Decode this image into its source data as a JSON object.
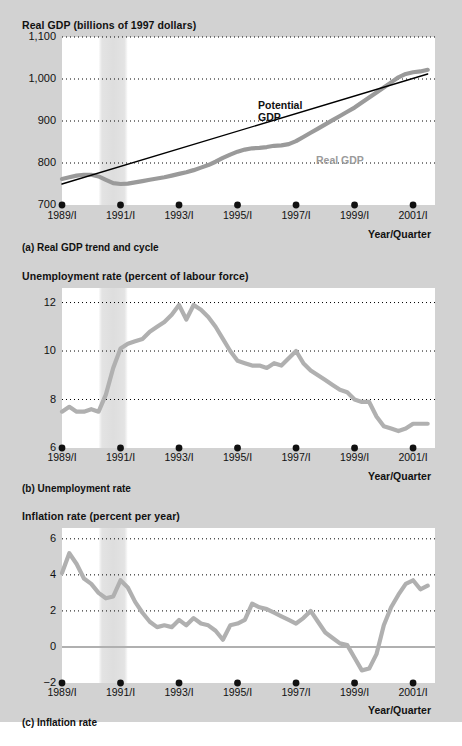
{
  "figure": {
    "background": "#d2d2d2",
    "plot_background": "#ffffff",
    "accent_grey": "#a8a8a8",
    "line_black": "#000000"
  },
  "panels": [
    {
      "id": "a",
      "title": "Real GDP (billions of 1997 dollars)",
      "caption": "(a) Real GDP trend and cycle",
      "x_axis_name": "Year/Quarter",
      "y_ticks": [
        "1,100",
        "1,000",
        "900",
        "800",
        "700"
      ],
      "x_ticks": [
        "1989/I",
        "1991/I",
        "1993/I",
        "1995/I",
        "1997/I",
        "1999/I",
        "2001/I"
      ],
      "series_labels": [
        {
          "name": "Potential GDP",
          "line1": "Potential",
          "line2": "GDP",
          "color": "#000000"
        },
        {
          "name": "Real GDP",
          "line1": "Real GDP",
          "line2": "",
          "color": "#9a9a9a"
        }
      ]
    },
    {
      "id": "b",
      "title": "Unemployment rate (percent of labour force)",
      "caption": "(b) Unemployment rate",
      "x_axis_name": "Year/Quarter",
      "y_ticks": [
        "12",
        "10",
        "8",
        "6"
      ],
      "x_ticks": [
        "1989/I",
        "1991/I",
        "1993/I",
        "1995/I",
        "1997/I",
        "1999/I",
        "2001/I"
      ]
    },
    {
      "id": "c",
      "title": "Inflation rate (percent per year)",
      "caption": "(c) Inflation rate",
      "x_axis_name": "Year/Quarter",
      "y_ticks": [
        "6",
        "4",
        "2",
        "0",
        "−2"
      ],
      "x_ticks": [
        "1989/I",
        "1991/I",
        "1993/I",
        "1995/I",
        "1997/I",
        "1999/I",
        "2001/I"
      ]
    }
  ],
  "chart_data": [
    {
      "type": "line",
      "panel": "a",
      "title": "Real GDP (billions of 1997 dollars)",
      "xlabel": "Year/Quarter",
      "ylabel": "Real GDP (billions of 1997 dollars)",
      "ylim": [
        700,
        1100
      ],
      "yticks": [
        700,
        800,
        900,
        1000,
        1100
      ],
      "xlim": [
        1989.0,
        2001.75
      ],
      "xticks": [
        1989,
        1991,
        1993,
        1995,
        1997,
        1999,
        2001
      ],
      "xticklabels": [
        "1989/I",
        "1991/I",
        "1993/I",
        "1995/I",
        "1997/I",
        "1999/I",
        "2001/I"
      ],
      "grid": "horizontal-dotted",
      "legend": "inline-annotations",
      "recession_shading": [
        [
          1990.25,
          1991.25
        ]
      ],
      "series": [
        {
          "name": "Real GDP",
          "color": "#9a9a9a",
          "x": [
            1989.0,
            1989.25,
            1989.5,
            1989.75,
            1990.0,
            1990.25,
            1990.5,
            1990.75,
            1991.0,
            1991.25,
            1991.5,
            1991.75,
            1992.0,
            1992.25,
            1992.5,
            1992.75,
            1993.0,
            1993.25,
            1993.5,
            1993.75,
            1994.0,
            1994.25,
            1994.5,
            1994.75,
            1995.0,
            1995.25,
            1995.5,
            1995.75,
            1996.0,
            1996.25,
            1996.5,
            1996.75,
            1997.0,
            1997.25,
            1997.5,
            1997.75,
            1998.0,
            1998.25,
            1998.5,
            1998.75,
            1999.0,
            1999.25,
            1999.5,
            1999.75,
            2000.0,
            2000.25,
            2000.5,
            2000.75,
            2001.0,
            2001.25,
            2001.5
          ],
          "y": [
            762,
            766,
            770,
            772,
            772,
            768,
            760,
            752,
            750,
            751,
            754,
            757,
            760,
            763,
            766,
            770,
            774,
            778,
            783,
            789,
            795,
            803,
            812,
            820,
            827,
            832,
            835,
            836,
            838,
            841,
            842,
            845,
            852,
            862,
            872,
            882,
            892,
            902,
            912,
            922,
            932,
            944,
            956,
            968,
            980,
            992,
            1004,
            1012,
            1016,
            1018,
            1022
          ]
        },
        {
          "name": "Potential GDP",
          "color": "#000000",
          "x": [
            1989.0,
            2001.5
          ],
          "y": [
            750,
            1012
          ]
        }
      ]
    },
    {
      "type": "line",
      "panel": "b",
      "title": "Unemployment rate (percent of labour force)",
      "xlabel": "Year/Quarter",
      "ylabel": "Unemployment rate (percent of labour force)",
      "ylim": [
        6,
        12.6
      ],
      "yticks": [
        6,
        8,
        10,
        12
      ],
      "xlim": [
        1989.0,
        2001.75
      ],
      "xticks": [
        1989,
        1991,
        1993,
        1995,
        1997,
        1999,
        2001
      ],
      "xticklabels": [
        "1989/I",
        "1991/I",
        "1993/I",
        "1995/I",
        "1997/I",
        "1999/I",
        "2001/I"
      ],
      "grid": "horizontal-dotted",
      "recession_shading": [
        [
          1990.25,
          1991.25
        ]
      ],
      "series": [
        {
          "name": "Unemployment rate",
          "color": "#b0b0b0",
          "x": [
            1989.0,
            1989.25,
            1989.5,
            1989.75,
            1990.0,
            1990.25,
            1990.5,
            1990.75,
            1991.0,
            1991.25,
            1991.5,
            1991.75,
            1992.0,
            1992.25,
            1992.5,
            1992.75,
            1993.0,
            1993.25,
            1993.5,
            1993.75,
            1994.0,
            1994.25,
            1994.5,
            1994.75,
            1995.0,
            1995.25,
            1995.5,
            1995.75,
            1996.0,
            1996.25,
            1996.5,
            1996.75,
            1997.0,
            1997.25,
            1997.5,
            1997.75,
            1998.0,
            1998.25,
            1998.5,
            1998.75,
            1999.0,
            1999.25,
            1999.5,
            1999.75,
            2000.0,
            2000.25,
            2000.5,
            2000.75,
            2001.0,
            2001.25,
            2001.5
          ],
          "y": [
            7.5,
            7.7,
            7.5,
            7.5,
            7.6,
            7.5,
            8.2,
            9.3,
            10.1,
            10.3,
            10.4,
            10.5,
            10.8,
            11.0,
            11.2,
            11.5,
            11.9,
            11.3,
            11.9,
            11.7,
            11.4,
            11.0,
            10.5,
            10.0,
            9.6,
            9.5,
            9.4,
            9.4,
            9.3,
            9.5,
            9.4,
            9.7,
            10.0,
            9.5,
            9.2,
            9.0,
            8.8,
            8.6,
            8.4,
            8.3,
            8.0,
            7.9,
            7.9,
            7.3,
            6.9,
            6.8,
            6.7,
            6.8,
            7.0,
            7.0,
            7.0
          ]
        }
      ]
    },
    {
      "type": "line",
      "panel": "c",
      "title": "Inflation rate (percent per year)",
      "xlabel": "Year/Quarter",
      "ylabel": "Inflation rate (percent per year)",
      "ylim": [
        -2,
        6.6
      ],
      "yticks": [
        -2,
        0,
        2,
        4,
        6
      ],
      "xlim": [
        1989.0,
        2001.75
      ],
      "xticks": [
        1989,
        1991,
        1993,
        1995,
        1997,
        1999,
        2001
      ],
      "xticklabels": [
        "1989/I",
        "1991/I",
        "1993/I",
        "1995/I",
        "1997/I",
        "1999/I",
        "2001/I"
      ],
      "grid": "horizontal-dotted",
      "zero_line": true,
      "recession_shading": [
        [
          1990.25,
          1991.25
        ]
      ],
      "series": [
        {
          "name": "Inflation rate",
          "color": "#b0b0b0",
          "x": [
            1989.0,
            1989.25,
            1989.5,
            1989.75,
            1990.0,
            1990.25,
            1990.5,
            1990.75,
            1991.0,
            1991.25,
            1991.5,
            1991.75,
            1992.0,
            1992.25,
            1992.5,
            1992.75,
            1993.0,
            1993.25,
            1993.5,
            1993.75,
            1994.0,
            1994.25,
            1994.5,
            1994.75,
            1995.0,
            1995.25,
            1995.5,
            1995.75,
            1996.0,
            1996.25,
            1996.5,
            1996.75,
            1997.0,
            1997.25,
            1997.5,
            1997.75,
            1998.0,
            1998.25,
            1998.5,
            1998.75,
            1999.0,
            1999.25,
            1999.5,
            1999.75,
            2000.0,
            2000.25,
            2000.5,
            2000.75,
            2001.0,
            2001.25,
            2001.5
          ],
          "y": [
            4.1,
            5.2,
            4.6,
            3.8,
            3.5,
            3.0,
            2.7,
            2.8,
            3.7,
            3.3,
            2.5,
            1.9,
            1.4,
            1.1,
            1.2,
            1.1,
            1.5,
            1.2,
            1.6,
            1.3,
            1.2,
            0.9,
            0.4,
            1.2,
            1.3,
            1.5,
            2.4,
            2.2,
            2.1,
            1.9,
            1.7,
            1.5,
            1.3,
            1.6,
            2.0,
            1.4,
            0.8,
            0.5,
            0.2,
            0.1,
            -0.6,
            -1.3,
            -1.2,
            -0.4,
            1.2,
            2.2,
            2.9,
            3.5,
            3.7,
            3.2,
            3.4
          ]
        }
      ]
    }
  ]
}
